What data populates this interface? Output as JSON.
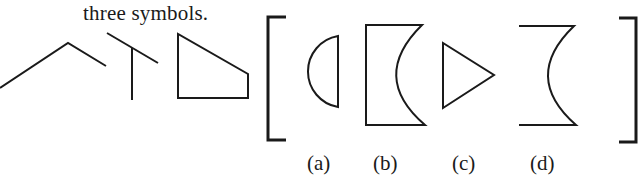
{
  "caption": {
    "text": "three symbols."
  },
  "stroke_color": "#1a1a1a",
  "given_symbols": [
    {
      "name": "chevron"
    },
    {
      "name": "t-shape"
    },
    {
      "name": "trapezoid"
    }
  ],
  "options": [
    {
      "label": "(a)",
      "shape": "half-disc"
    },
    {
      "label": "(b)",
      "shape": "rectangle-with-concave-right-side"
    },
    {
      "label": "(c)",
      "shape": "triangle-pointing-right"
    },
    {
      "label": "(d)",
      "shape": "open-concave-arc-with-horizontal-caps"
    }
  ]
}
